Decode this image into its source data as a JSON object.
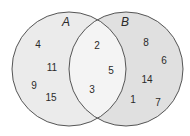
{
  "diagram": {
    "type": "venn",
    "colors": {
      "only_a": "#ebebeb",
      "intersection": "#f4f4f4",
      "only_b": "#e0e0e0",
      "outline": "#555555"
    },
    "sets": [
      {
        "name": "A",
        "cx": 69,
        "cy": 69,
        "r": 57,
        "label_x": 66,
        "label_y": 26
      },
      {
        "name": "B",
        "cx": 126,
        "cy": 69,
        "r": 57,
        "label_x": 125,
        "label_y": 26
      }
    ],
    "regions": {
      "only_a": [
        {
          "v": "4",
          "x": 38,
          "y": 48
        },
        {
          "v": "11",
          "x": 52,
          "y": 71
        },
        {
          "v": "9",
          "x": 34,
          "y": 89
        },
        {
          "v": "15",
          "x": 51,
          "y": 101
        }
      ],
      "intersection": [
        {
          "v": "2",
          "x": 97,
          "y": 49
        },
        {
          "v": "5",
          "x": 111,
          "y": 74
        },
        {
          "v": "3",
          "x": 92,
          "y": 93
        }
      ],
      "only_b": [
        {
          "v": "8",
          "x": 146,
          "y": 46
        },
        {
          "v": "6",
          "x": 164,
          "y": 64
        },
        {
          "v": "14",
          "x": 147,
          "y": 83
        },
        {
          "v": "1",
          "x": 133,
          "y": 103
        },
        {
          "v": "7",
          "x": 158,
          "y": 106
        }
      ]
    }
  }
}
